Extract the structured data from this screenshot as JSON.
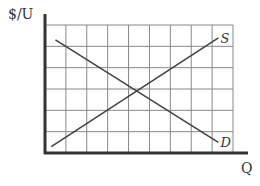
{
  "chart_data": {
    "type": "line",
    "title": "",
    "xlabel": "Q",
    "ylabel": "$/U",
    "grid": true,
    "grid_columns": 9,
    "grid_rows": 6,
    "axis_ticks_labeled": false,
    "values_note": "Qualitative diagram with no numeric tick labels; the coordinates below are approximate endpoints estimated in grid units (1 unit = 1 grid cell) from the gridlines, not values stated in the figure.",
    "xlim": [
      0,
      9
    ],
    "ylim": [
      0,
      6
    ],
    "series": [
      {
        "name": "D",
        "description": "Demand curve (downward sloping)",
        "approx_points": [
          [
            0.5,
            5.3
          ],
          [
            8.3,
            0.5
          ]
        ]
      },
      {
        "name": "S",
        "description": "Supply curve (upward sloping)",
        "approx_points": [
          [
            0.3,
            0.3
          ],
          [
            8.3,
            5.4
          ]
        ]
      }
    ],
    "legend": "none; curves labeled inline at right ends (S, D)",
    "colors": {
      "axes": "#333333",
      "grid": "#888888",
      "curves": "#444444"
    }
  }
}
